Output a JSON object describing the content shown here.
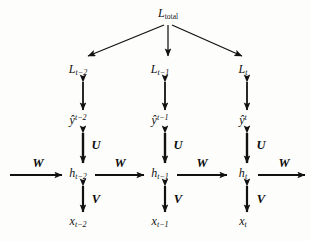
{
  "figure": {
    "type": "diagram",
    "background_color": "#fdfdfc",
    "stroke_color": "#111111"
  },
  "nodes": {
    "total_loss": {
      "symbol": "L",
      "subscript": "total",
      "x": 168,
      "y": 14
    },
    "losses": [
      {
        "symbol": "L",
        "subscript": "t−2",
        "x": 78,
        "y": 70
      },
      {
        "symbol": "L",
        "subscript": "t−1",
        "x": 160,
        "y": 70
      },
      {
        "symbol": "L",
        "subscript": "t",
        "x": 243,
        "y": 70
      }
    ],
    "predictions": [
      {
        "symbol": "ŷ",
        "superscript": "t−2",
        "x": 78,
        "y": 120
      },
      {
        "symbol": "ŷ",
        "superscript": "t−1",
        "x": 160,
        "y": 120
      },
      {
        "symbol": "ŷ",
        "superscript": "t",
        "x": 243,
        "y": 120
      }
    ],
    "hidden_states": [
      {
        "symbol": "h",
        "subscript": "t−2",
        "x": 78,
        "y": 174
      },
      {
        "symbol": "h",
        "subscript": "t−1",
        "x": 160,
        "y": 174
      },
      {
        "symbol": "h",
        "subscript": "t",
        "x": 243,
        "y": 174
      }
    ],
    "inputs": [
      {
        "symbol": "x",
        "subscript": "t−2",
        "x": 78,
        "y": 222
      },
      {
        "symbol": "x",
        "subscript": "t−1",
        "x": 160,
        "y": 222
      },
      {
        "symbol": "x",
        "subscript": "t",
        "x": 243,
        "y": 222
      }
    ]
  },
  "weights": {
    "recurrent": {
      "label": "W",
      "positions": [
        {
          "x": 38,
          "y": 163
        },
        {
          "x": 120,
          "y": 163
        },
        {
          "x": 202,
          "y": 163
        },
        {
          "x": 284,
          "y": 163
        }
      ]
    },
    "output": {
      "label": "U",
      "positions": [
        {
          "x": 96,
          "y": 145
        },
        {
          "x": 178,
          "y": 145
        },
        {
          "x": 261,
          "y": 145
        }
      ]
    },
    "input": {
      "label": "V",
      "positions": [
        {
          "x": 96,
          "y": 199
        },
        {
          "x": 178,
          "y": 199
        },
        {
          "x": 261,
          "y": 199
        }
      ]
    }
  },
  "edges": {
    "loss_fanout_label": "total-loss-to-step-loss",
    "loss_to_pred_label": "loss-prediction-double-arrow",
    "pred_to_hidden_label": "prediction-hidden-double-arrow",
    "hidden_to_input_label": "hidden-input-double-arrow",
    "recurrent_label": "hidden-to-hidden-arrow"
  }
}
